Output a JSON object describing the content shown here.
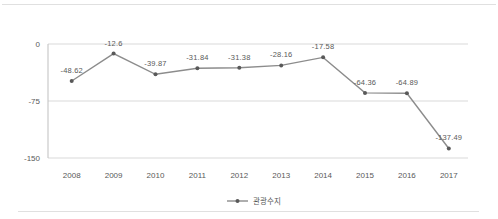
{
  "figure": {
    "legend": {
      "label": "관광수지",
      "position": "bottom"
    }
  },
  "chart_data": {
    "type": "line",
    "title": "",
    "xlabel": "",
    "ylabel": "",
    "categories": [
      "2008",
      "2009",
      "2010",
      "2011",
      "2012",
      "2013",
      "2014",
      "2015",
      "2016",
      "2017"
    ],
    "series": [
      {
        "name": "관광수지",
        "values": [
          -48.62,
          -12.6,
          -39.87,
          -31.84,
          -31.38,
          -28.16,
          -17.58,
          -64.36,
          -64.89,
          -137.49
        ],
        "value_labels": [
          "-48.62",
          "-12.6",
          "-39.87",
          "-31.84",
          "-31.38",
          "-28.16",
          "-17.58",
          "-64.36",
          "-64.89",
          "-137.49"
        ]
      }
    ],
    "ylim": [
      -150,
      0
    ],
    "yticks": [
      0,
      -75,
      -150
    ],
    "ytick_labels": [
      "0",
      "-75",
      "-150"
    ],
    "grid": true,
    "legend_position": "bottom",
    "colors": {
      "line": "#8c8c8c",
      "marker": "#595959",
      "label": "#595959",
      "grid": "#d9d9d9",
      "axis": "#bfbfbf",
      "border": "#e0e0e0"
    }
  }
}
